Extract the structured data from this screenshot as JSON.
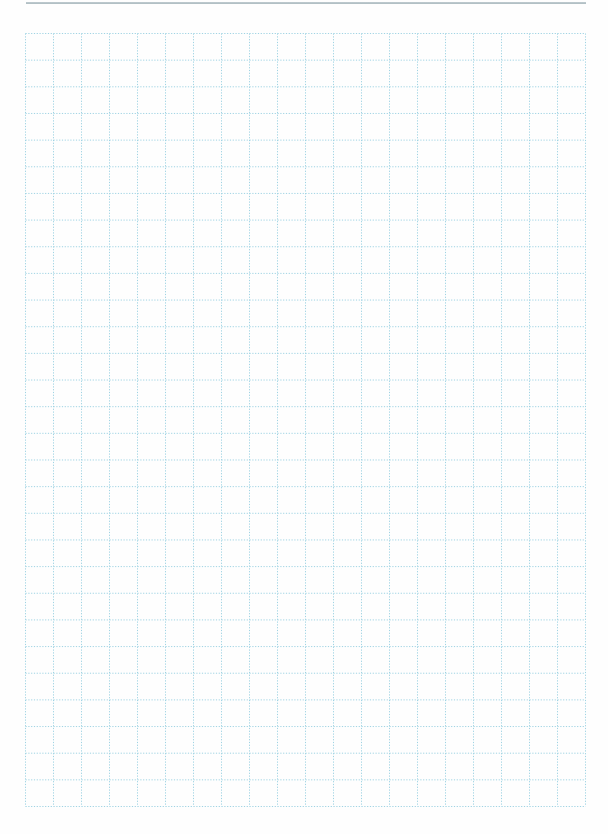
{
  "page": {
    "type": "grid-paper",
    "header_rule": true
  },
  "grid": {
    "columns": 20,
    "rows": 29,
    "left": 25,
    "top": 33,
    "width": 560,
    "height": 773,
    "line_style": "dotted",
    "line_color": "#9fd3e3",
    "border_color": "#9fd3e3"
  },
  "colors": {
    "paper": "#fefefe",
    "rule": "#9fb0b6"
  }
}
